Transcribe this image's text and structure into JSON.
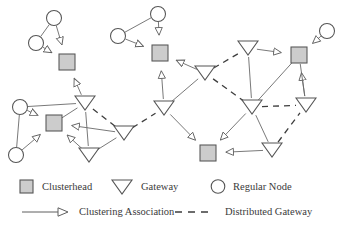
{
  "figure": {
    "type": "network-topology-diagram",
    "background_color": "#ffffff",
    "width": 341,
    "height": 240
  },
  "colors": {
    "node_fill": "#cccccc",
    "node_stroke": "#555555",
    "circle_fill": "#ffffff",
    "gateway_fill": "#ffffff",
    "edge": "#6a6a6a",
    "dashed_edge": "#3d3d3d",
    "text": "#3a3a3a"
  },
  "legend": {
    "row1": [
      {
        "icon": "square-icon",
        "label": "Clusterhead"
      },
      {
        "icon": "triangle-down-icon",
        "label": "Gateway"
      },
      {
        "icon": "circle-icon",
        "label": "Regular Node"
      }
    ],
    "row2": [
      {
        "icon": "arrow-line-icon",
        "label": "Clustering Association"
      },
      {
        "icon": "dashed-line-icon",
        "label": "Distributed Gateway"
      }
    ]
  },
  "chart_data": {
    "type": "diagram",
    "title": "",
    "nodes": [
      {
        "id": "c1",
        "kind": "clusterhead",
        "x": 67,
        "y": 62
      },
      {
        "id": "c2",
        "kind": "clusterhead",
        "x": 54,
        "y": 123
      },
      {
        "id": "c3",
        "kind": "clusterhead",
        "x": 160,
        "y": 53
      },
      {
        "id": "c4",
        "kind": "clusterhead",
        "x": 208,
        "y": 153
      },
      {
        "id": "c5",
        "kind": "clusterhead",
        "x": 299,
        "y": 55
      },
      {
        "id": "r1",
        "kind": "regular",
        "x": 54,
        "y": 18
      },
      {
        "id": "r2",
        "kind": "regular",
        "x": 36,
        "y": 43
      },
      {
        "id": "r3",
        "kind": "regular",
        "x": 20,
        "y": 107
      },
      {
        "id": "r4",
        "kind": "regular",
        "x": 16,
        "y": 155
      },
      {
        "id": "r5",
        "kind": "regular",
        "x": 158,
        "y": 14
      },
      {
        "id": "r6",
        "kind": "regular",
        "x": 118,
        "y": 36
      },
      {
        "id": "r7",
        "kind": "regular",
        "x": 327,
        "y": 31
      },
      {
        "id": "g1",
        "kind": "gateway",
        "x": 85,
        "y": 103
      },
      {
        "id": "g2",
        "kind": "gateway",
        "x": 124,
        "y": 133
      },
      {
        "id": "g3",
        "kind": "gateway",
        "x": 89,
        "y": 155
      },
      {
        "id": "g4",
        "kind": "gateway",
        "x": 205,
        "y": 73
      },
      {
        "id": "g5",
        "kind": "gateway",
        "x": 164,
        "y": 108
      },
      {
        "id": "g6",
        "kind": "gateway",
        "x": 248,
        "y": 48
      },
      {
        "id": "g7",
        "kind": "gateway",
        "x": 252,
        "y": 107
      },
      {
        "id": "g8",
        "kind": "gateway",
        "x": 272,
        "y": 150
      },
      {
        "id": "g9",
        "kind": "gateway",
        "x": 306,
        "y": 105
      }
    ],
    "solid_edges": [
      {
        "from": "r1",
        "to": "c1",
        "arrow": true
      },
      {
        "from": "r2",
        "to": "c1",
        "arrow": true
      },
      {
        "from": "r1",
        "to": "r2",
        "arrow": false
      },
      {
        "from": "g1",
        "to": "c1",
        "arrow": true
      },
      {
        "from": "r3",
        "to": "c2",
        "arrow": true
      },
      {
        "from": "r4",
        "to": "c2",
        "arrow": true
      },
      {
        "from": "r3",
        "to": "r4",
        "arrow": false
      },
      {
        "from": "r3",
        "to": "g1",
        "arrow": false
      },
      {
        "from": "g1",
        "to": "c2",
        "arrow": false
      },
      {
        "from": "g3",
        "to": "c2",
        "arrow": true
      },
      {
        "from": "g2",
        "to": "c2",
        "arrow": true
      },
      {
        "from": "g1",
        "to": "g3",
        "arrow": false
      },
      {
        "from": "g2",
        "to": "g3",
        "arrow": false
      },
      {
        "from": "r5",
        "to": "c3",
        "arrow": true
      },
      {
        "from": "r6",
        "to": "c3",
        "arrow": true
      },
      {
        "from": "r5",
        "to": "r6",
        "arrow": false
      },
      {
        "from": "g4",
        "to": "c3",
        "arrow": true
      },
      {
        "from": "g5",
        "to": "c3",
        "arrow": true
      },
      {
        "from": "g4",
        "to": "g5",
        "arrow": false
      },
      {
        "from": "g5",
        "to": "c4",
        "arrow": true
      },
      {
        "from": "g8",
        "to": "c4",
        "arrow": true
      },
      {
        "from": "g7",
        "to": "c4",
        "arrow": true
      },
      {
        "from": "g7",
        "to": "g8",
        "arrow": false
      },
      {
        "from": "g6",
        "to": "c5",
        "arrow": true
      },
      {
        "from": "r7",
        "to": "c5",
        "arrow": true
      },
      {
        "from": "g6",
        "to": "g7",
        "arrow": false
      },
      {
        "from": "g9",
        "to": "c5",
        "arrow": true
      },
      {
        "from": "c5",
        "to": "g9",
        "arrow": false
      },
      {
        "from": "g7",
        "to": "c5",
        "arrow": false
      }
    ],
    "dashed_edges": [
      {
        "from": "g1",
        "to": "g2"
      },
      {
        "from": "g2",
        "to": "g5"
      },
      {
        "from": "g4",
        "to": "g6"
      },
      {
        "from": "g4",
        "to": "g7"
      },
      {
        "from": "g7",
        "to": "g9"
      },
      {
        "from": "g8",
        "to": "g9"
      }
    ]
  }
}
